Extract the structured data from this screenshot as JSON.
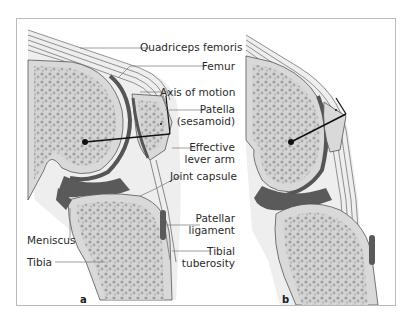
{
  "figure": {
    "panels": [
      {
        "id": "a",
        "tag": "a"
      },
      {
        "id": "b",
        "tag": "b"
      }
    ],
    "labels": {
      "quadriceps": "Quadriceps femoris",
      "femur": "Femur",
      "axis": "Axis of motion",
      "patella_1": "Patella",
      "patella_2": "(sesamoid)",
      "lever_1": "Effective",
      "lever_2": "lever arm",
      "capsule": "Joint capsule",
      "patellar_lig_1": "Patellar",
      "patellar_lig_2": "ligament",
      "meniscus": "Meniscus",
      "tibia": "Tibia",
      "tuberosity_1": "Tibial",
      "tuberosity_2": "tuberosity"
    },
    "colors": {
      "bone_light": "#d9d9d9",
      "bone_spongy": "#a8a8a8",
      "cartilage_dark": "#5a5a5a",
      "soft_tissue": "#eeeeee",
      "line": "#555555",
      "frame": "#b9b9b9"
    }
  }
}
